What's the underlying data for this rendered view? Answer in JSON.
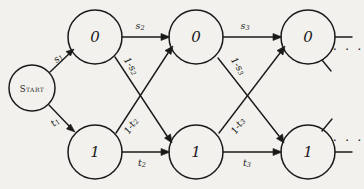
{
  "diagram": {
    "background_color": "#f2f1ed",
    "ink_color": "#1a1a1a",
    "start_node": {
      "label": "Start",
      "cx": 32,
      "cy": 88,
      "r": 23
    },
    "top_row_nodes": [
      {
        "label": "0",
        "cx": 95,
        "cy": 37,
        "r": 27
      },
      {
        "label": "0",
        "cx": 196,
        "cy": 37,
        "r": 27
      },
      {
        "label": "0",
        "cx": 308,
        "cy": 37,
        "r": 27
      }
    ],
    "bottom_row_nodes": [
      {
        "label": "1",
        "cx": 95,
        "cy": 152,
        "r": 27
      },
      {
        "label": "1",
        "cx": 196,
        "cy": 152,
        "r": 27
      },
      {
        "label": "1",
        "cx": 308,
        "cy": 152,
        "r": 27
      }
    ],
    "edge_labels": {
      "start_to_zero": {
        "base": "s",
        "sub": "1",
        "x": 58,
        "y": 58
      },
      "start_to_one": {
        "base": "t",
        "sub": "1",
        "x": 55,
        "y": 122
      },
      "zero1_to_zero2": {
        "base": "s",
        "sub": "2",
        "x": 140,
        "y": 26
      },
      "zero2_to_zero3": {
        "base": "s",
        "sub": "3",
        "x": 245,
        "y": 26
      },
      "one1_to_one2": {
        "base": "t",
        "sub": "2",
        "x": 142,
        "y": 163
      },
      "one2_to_one3": {
        "base": "t",
        "sub": "3",
        "x": 247,
        "y": 163
      },
      "zero1_to_one2": {
        "base": "1-s",
        "sub": "2",
        "x": 128,
        "y": 65
      },
      "zero2_to_one3": {
        "base": "1-s",
        "sub": "3",
        "x": 235,
        "y": 65
      },
      "one1_to_zero2": {
        "base": "1-t",
        "sub": "2",
        "x": 128,
        "y": 127
      },
      "one2_to_zero3": {
        "base": "1-t",
        "sub": "3",
        "x": 235,
        "y": 127
      }
    },
    "ellipsis": {
      "glyph": "· · ·",
      "top": {
        "x": 348,
        "y": 47
      },
      "bottom": {
        "x": 348,
        "y": 144
      }
    }
  }
}
